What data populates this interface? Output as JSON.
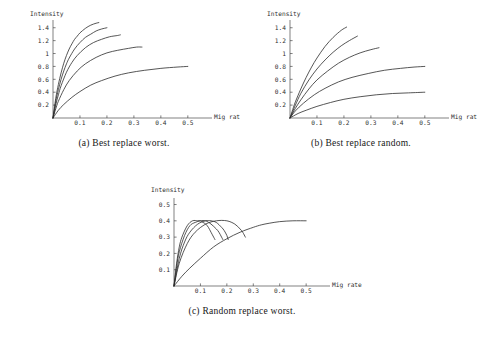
{
  "figure": {
    "background_color": "#ffffff",
    "line_color": "#2b2b2b",
    "axis_color": "#4a4a4a"
  },
  "panels": [
    {
      "id": "a",
      "caption_tag": "(a)",
      "caption_text": "Best replace worst.",
      "caption_full": "(a)  Best replace worst."
    },
    {
      "id": "b",
      "caption_tag": "(b)",
      "caption_text": "Best replace random.",
      "caption_full": "(b)  Best replace random."
    },
    {
      "id": "c",
      "caption_tag": "(c)",
      "caption_text": "Random replace worst.",
      "caption_full": "(c)  Random replace worst."
    }
  ],
  "chart_data": [
    {
      "panel": "a",
      "type": "line",
      "title": "",
      "xlabel": "Mig rate",
      "ylabel": "Intensity",
      "xlim": [
        0,
        0.56
      ],
      "ylim": [
        0,
        1.52
      ],
      "grid": false,
      "legend": "none",
      "xticks": [
        0.1,
        0.2,
        0.3,
        0.4,
        0.5
      ],
      "xtick_labels": [
        "0.1",
        "0.2",
        "0.3",
        "0.4",
        "0.5"
      ],
      "yticks": [
        0.2,
        0.4,
        0.6,
        0.8,
        1.0,
        1.2,
        1.4
      ],
      "ytick_labels": [
        "0.2",
        "0.4",
        "0.6",
        "0.8",
        "1",
        "1.2",
        "1.4"
      ],
      "series": [
        {
          "name": "curve-1",
          "x": [
            0.0,
            0.01,
            0.02,
            0.03,
            0.04,
            0.05,
            0.06,
            0.07,
            0.08,
            0.09,
            0.1,
            0.12,
            0.14,
            0.16,
            0.17
          ],
          "y": [
            0.0,
            0.3,
            0.52,
            0.7,
            0.85,
            0.97,
            1.07,
            1.15,
            1.22,
            1.27,
            1.32,
            1.39,
            1.44,
            1.47,
            1.48
          ]
        },
        {
          "name": "curve-2",
          "x": [
            0.0,
            0.01,
            0.02,
            0.03,
            0.04,
            0.05,
            0.06,
            0.08,
            0.1,
            0.12,
            0.14,
            0.16,
            0.18,
            0.2
          ],
          "y": [
            0.0,
            0.25,
            0.44,
            0.6,
            0.73,
            0.84,
            0.93,
            1.07,
            1.17,
            1.25,
            1.3,
            1.35,
            1.38,
            1.4
          ]
        },
        {
          "name": "curve-3",
          "x": [
            0.0,
            0.01,
            0.02,
            0.03,
            0.05,
            0.07,
            0.09,
            0.12,
            0.15,
            0.18,
            0.21,
            0.24,
            0.25
          ],
          "y": [
            0.0,
            0.2,
            0.36,
            0.5,
            0.71,
            0.86,
            0.97,
            1.09,
            1.17,
            1.22,
            1.26,
            1.28,
            1.29
          ]
        },
        {
          "name": "curve-4",
          "x": [
            0.0,
            0.01,
            0.02,
            0.04,
            0.06,
            0.09,
            0.12,
            0.16,
            0.2,
            0.24,
            0.28,
            0.31,
            0.33
          ],
          "y": [
            0.0,
            0.14,
            0.26,
            0.44,
            0.58,
            0.73,
            0.84,
            0.94,
            1.01,
            1.05,
            1.08,
            1.1,
            1.1
          ]
        },
        {
          "name": "curve-5",
          "x": [
            0.0,
            0.02,
            0.04,
            0.07,
            0.1,
            0.14,
            0.18,
            0.23,
            0.28,
            0.34,
            0.4,
            0.46,
            0.5
          ],
          "y": [
            0.0,
            0.12,
            0.21,
            0.32,
            0.41,
            0.51,
            0.58,
            0.65,
            0.7,
            0.74,
            0.77,
            0.79,
            0.8
          ]
        }
      ]
    },
    {
      "panel": "b",
      "type": "line",
      "title": "",
      "xlabel": "Mig rate",
      "ylabel": "Intensity",
      "xlim": [
        0,
        0.56
      ],
      "ylim": [
        0,
        1.52
      ],
      "grid": false,
      "legend": "none",
      "xticks": [
        0.1,
        0.2,
        0.3,
        0.4,
        0.5
      ],
      "xtick_labels": [
        "0.1",
        "0.2",
        "0.3",
        "0.4",
        "0.5"
      ],
      "yticks": [
        0.2,
        0.4,
        0.6,
        0.8,
        1.0,
        1.2,
        1.4
      ],
      "ytick_labels": [
        "0.2",
        "0.4",
        "0.6",
        "0.8",
        "1",
        "1.2",
        "1.4"
      ],
      "series": [
        {
          "name": "curve-1",
          "x": [
            0.0,
            0.01,
            0.02,
            0.04,
            0.06,
            0.08,
            0.1,
            0.13,
            0.16,
            0.19,
            0.21
          ],
          "y": [
            0.0,
            0.13,
            0.25,
            0.45,
            0.63,
            0.79,
            0.93,
            1.11,
            1.25,
            1.36,
            1.41
          ]
        },
        {
          "name": "curve-2",
          "x": [
            0.0,
            0.01,
            0.02,
            0.04,
            0.07,
            0.1,
            0.13,
            0.16,
            0.19,
            0.22,
            0.25
          ],
          "y": [
            0.0,
            0.1,
            0.2,
            0.38,
            0.59,
            0.76,
            0.9,
            1.02,
            1.12,
            1.2,
            1.27
          ]
        },
        {
          "name": "curve-3",
          "x": [
            0.0,
            0.02,
            0.04,
            0.07,
            0.1,
            0.14,
            0.18,
            0.22,
            0.26,
            0.3,
            0.33
          ],
          "y": [
            0.0,
            0.15,
            0.28,
            0.45,
            0.59,
            0.73,
            0.85,
            0.94,
            1.01,
            1.06,
            1.09
          ]
        },
        {
          "name": "curve-4",
          "x": [
            0.0,
            0.02,
            0.05,
            0.09,
            0.13,
            0.18,
            0.23,
            0.29,
            0.35,
            0.41,
            0.46,
            0.5
          ],
          "y": [
            0.0,
            0.11,
            0.23,
            0.36,
            0.46,
            0.56,
            0.63,
            0.69,
            0.74,
            0.77,
            0.79,
            0.8
          ]
        },
        {
          "name": "curve-5",
          "x": [
            0.0,
            0.03,
            0.06,
            0.1,
            0.15,
            0.2,
            0.26,
            0.32,
            0.38,
            0.44,
            0.5
          ],
          "y": [
            0.0,
            0.07,
            0.12,
            0.18,
            0.24,
            0.29,
            0.33,
            0.36,
            0.38,
            0.39,
            0.4
          ]
        }
      ]
    },
    {
      "panel": "c",
      "type": "line",
      "title": "",
      "xlabel": "Mig rate",
      "ylabel": "Intensity",
      "xlim": [
        0,
        0.56
      ],
      "ylim": [
        0,
        0.54
      ],
      "grid": false,
      "legend": "none",
      "xticks": [
        0.1,
        0.2,
        0.3,
        0.4,
        0.5
      ],
      "xtick_labels": [
        "0.1",
        "0.2",
        "0.3",
        "0.4",
        "0.5"
      ],
      "yticks": [
        0.1,
        0.2,
        0.3,
        0.4,
        0.5
      ],
      "ytick_labels": [
        "0.1",
        "0.2",
        "0.3",
        "0.4",
        "0.5"
      ],
      "series": [
        {
          "name": "curve-1",
          "x": [
            0.0,
            0.01,
            0.02,
            0.03,
            0.05,
            0.07,
            0.09,
            0.1,
            0.11,
            0.12,
            0.13,
            0.14,
            0.15,
            0.155
          ],
          "y": [
            0.0,
            0.14,
            0.24,
            0.3,
            0.37,
            0.4,
            0.4,
            0.4,
            0.39,
            0.38,
            0.36,
            0.33,
            0.3,
            0.285
          ]
        },
        {
          "name": "curve-2",
          "x": [
            0.0,
            0.01,
            0.02,
            0.04,
            0.06,
            0.08,
            0.1,
            0.12,
            0.14,
            0.16,
            0.17,
            0.18,
            0.185
          ],
          "y": [
            0.0,
            0.12,
            0.21,
            0.31,
            0.37,
            0.39,
            0.4,
            0.4,
            0.38,
            0.35,
            0.33,
            0.3,
            0.285
          ]
        },
        {
          "name": "curve-3",
          "x": [
            0.0,
            0.02,
            0.04,
            0.06,
            0.09,
            0.12,
            0.14,
            0.16,
            0.18,
            0.19,
            0.2,
            0.205
          ],
          "y": [
            0.0,
            0.17,
            0.27,
            0.33,
            0.38,
            0.4,
            0.4,
            0.39,
            0.36,
            0.34,
            0.31,
            0.285
          ]
        },
        {
          "name": "curve-4",
          "x": [
            0.0,
            0.02,
            0.05,
            0.08,
            0.12,
            0.16,
            0.2,
            0.23,
            0.25,
            0.26,
            0.27
          ],
          "y": [
            0.0,
            0.14,
            0.26,
            0.33,
            0.38,
            0.4,
            0.4,
            0.38,
            0.35,
            0.33,
            0.3
          ]
        },
        {
          "name": "curve-5",
          "x": [
            0.0,
            0.03,
            0.06,
            0.1,
            0.15,
            0.2,
            0.25,
            0.3,
            0.33,
            0.36,
            0.4,
            0.45,
            0.5
          ],
          "y": [
            0.0,
            0.06,
            0.11,
            0.17,
            0.24,
            0.29,
            0.33,
            0.36,
            0.375,
            0.385,
            0.395,
            0.4,
            0.4
          ]
        }
      ]
    }
  ]
}
